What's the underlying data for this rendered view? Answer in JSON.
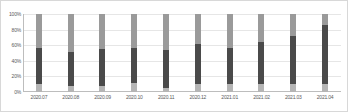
{
  "chart_data": {
    "type": "bar",
    "title": "",
    "subtitle": "",
    "xlabel": "",
    "ylabel": "",
    "stacked": true,
    "normalized_percent": true,
    "grid": true,
    "legend": "none",
    "ylim": [
      0,
      100
    ],
    "ytick_labels": [
      "100%",
      "80%",
      "60%",
      "40%",
      "20%",
      "0%"
    ],
    "ytick_values": [
      100,
      80,
      60,
      40,
      20,
      0
    ],
    "categories": [
      "2020.07",
      "2020.08",
      "2020.09",
      "2020.10",
      "2020.11",
      "2020.12",
      "2021.01",
      "2021.02",
      "2021.03",
      "2021.04"
    ],
    "series": [
      {
        "name": "top-segment",
        "color": "#9a9a9a",
        "values": [
          43,
          49,
          45,
          44,
          46,
          39,
          43,
          36,
          28,
          14
        ]
      },
      {
        "name": "middle-segment",
        "color": "#4a4a4a",
        "values": [
          47,
          43,
          47,
          44,
          49,
          51,
          47,
          54,
          62,
          76
        ]
      },
      {
        "name": "bottom-segment",
        "color": "#b5b5b5",
        "values": [
          10,
          8,
          8,
          12,
          5,
          10,
          10,
          10,
          10,
          10
        ]
      }
    ]
  },
  "colors": {
    "top": "#9a9a9a",
    "middle": "#4a4a4a",
    "bottom": "#b5b5b5",
    "grid": "#e6e6e6",
    "axis": "#bdbdbd",
    "border": "#d8d8d8",
    "tick_text": "#5a5a5a",
    "background": "#ffffff"
  }
}
